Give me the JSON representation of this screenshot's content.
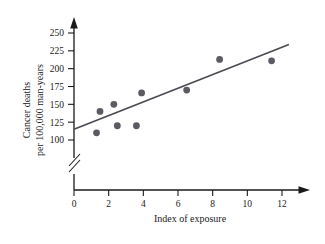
{
  "chart_data": {
    "type": "scatter",
    "title": "",
    "xlabel": "Index of exposure",
    "ylabel": "Cancer deaths\nper 100,000 man-years",
    "ylabel_line1": "Cancer deaths",
    "ylabel_line2": "per 100,000 man-years",
    "xlim": [
      0,
      12.8
    ],
    "ylim": [
      100,
      250
    ],
    "y_axis_broken": true,
    "y_break_note": "axis break below 100",
    "grid": false,
    "legend": null,
    "xticks": [
      0,
      2,
      4,
      6,
      8,
      10,
      12
    ],
    "xticklabels": [
      "0",
      "2",
      "4",
      "6",
      "8",
      "10",
      "12"
    ],
    "yticks": [
      100,
      125,
      150,
      175,
      200,
      225,
      250
    ],
    "yticklabels": [
      "100",
      "125",
      "150",
      "175",
      "200",
      "225",
      "250"
    ],
    "points": [
      {
        "x": 1.3,
        "y": 110
      },
      {
        "x": 1.5,
        "y": 140
      },
      {
        "x": 2.3,
        "y": 150
      },
      {
        "x": 2.5,
        "y": 120
      },
      {
        "x": 3.6,
        "y": 120
      },
      {
        "x": 3.9,
        "y": 166
      },
      {
        "x": 6.5,
        "y": 170
      },
      {
        "x": 8.4,
        "y": 213
      },
      {
        "x": 11.4,
        "y": 211
      }
    ],
    "fit_line": {
      "type": "linear-regression",
      "x_start": 0.0,
      "y_start": 115,
      "x_end": 12.4,
      "y_end": 234
    },
    "marker": "filled-circle",
    "marker_color": "#5b5b63",
    "line_color": "#4a4a52",
    "axis_color": "#1a1a1a",
    "background_color": "#ffffff"
  },
  "axes": {
    "x_axis_name": "Index of exposure",
    "y_axis_name_top": "Cancer deaths",
    "y_axis_name_bottom": "per 100,000 man-years"
  }
}
